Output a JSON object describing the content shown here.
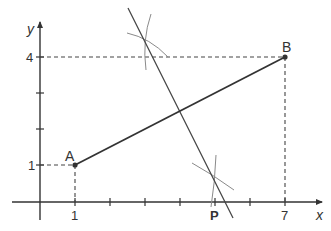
{
  "diagram": {
    "type": "geometry-construction",
    "axes": {
      "x_label": "x",
      "y_label": "y",
      "x_tick_labels": [
        "1",
        "P",
        "7"
      ],
      "y_tick_labels": [
        "1",
        "4"
      ]
    },
    "points": [
      {
        "name": "A",
        "label": "A",
        "x": 1,
        "y": 1
      },
      {
        "name": "B",
        "label": "B",
        "x": 7,
        "y": 4
      },
      {
        "name": "P",
        "label": "P",
        "x": 5,
        "y": 0
      }
    ],
    "segments": [
      {
        "from": "A",
        "to": "B",
        "style": "solid"
      }
    ],
    "construction": {
      "perpendicular_bisector_of": "AB",
      "arcs": 4
    },
    "colors": {
      "ink": "#333333",
      "arc": "#8a8a8a",
      "dashed": "#444444"
    }
  }
}
